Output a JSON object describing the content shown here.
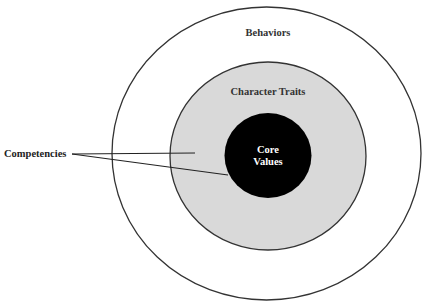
{
  "diagram": {
    "rings": [
      {
        "id": "behaviors",
        "label": "Behaviors",
        "fill": "#ffffff",
        "stroke": "#333333"
      },
      {
        "id": "character-traits",
        "label": "Character Traits",
        "fill": "#d9d9d9",
        "stroke": "#333333"
      },
      {
        "id": "core-values",
        "label_line1": "Core",
        "label_line2": "Values",
        "fill": "#000000",
        "text_color": "#ffffff"
      }
    ],
    "callout": {
      "label": "Competencies",
      "line_color": "#222222"
    }
  }
}
